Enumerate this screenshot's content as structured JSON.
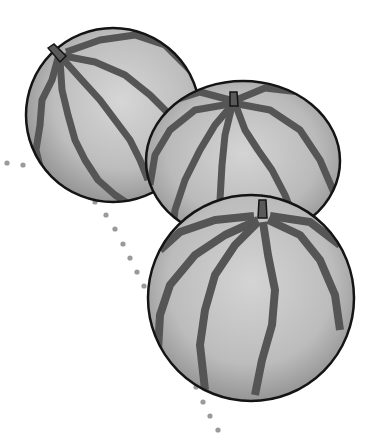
{
  "illustration": {
    "subject": "Three watermelons",
    "style": "grayscale cartoon line art",
    "melon_count": 3
  },
  "colors": {
    "background": "#ffffff",
    "rind_light": "#d0d0d0",
    "rind_mid": "#b4b4b4",
    "rind_shadow": "#8e8e8e",
    "stripe": "#555555",
    "outline": "#141414",
    "dots": "#9a9a9a"
  }
}
